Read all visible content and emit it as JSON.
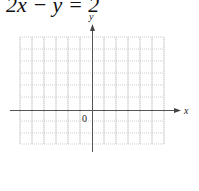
{
  "title": "2x − y = 2",
  "graph": {
    "x_axis_label": "x",
    "y_axis_label": "y",
    "origin_label": "0",
    "grid": {
      "columns": 12,
      "rows": 9,
      "style": "dotted"
    },
    "colors": {
      "grid": "#cfcfcf",
      "axis": "#555555"
    }
  }
}
